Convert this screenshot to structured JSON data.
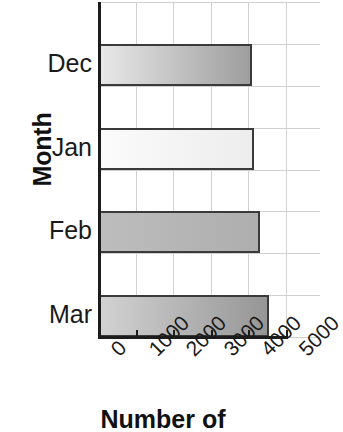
{
  "chart_data": {
    "type": "bar",
    "orientation": "horizontal",
    "title": "",
    "xlabel": "Number of",
    "ylabel": "Month",
    "categories": [
      "Dec",
      "Jan",
      "Feb",
      "Mar"
    ],
    "values": [
      4100,
      4150,
      4300,
      4550
    ],
    "xlim": [
      0,
      5000
    ],
    "xticks": [
      0,
      1000,
      2000,
      3000,
      4000,
      5000
    ],
    "xtick_labels": [
      "0",
      "1000",
      "2000",
      "3000",
      "4000",
      "5000"
    ],
    "xtick_rotation": -45,
    "grid": true,
    "grid_color": "#d2d2d2",
    "legend": "none",
    "bar_edge_color": "#3a3a3a",
    "bars": [
      {
        "category": "Dec",
        "value": 4100,
        "fill_start": "#e8e8e8",
        "fill_end": "#9e9e9e"
      },
      {
        "category": "Jan",
        "value": 4150,
        "fill_start": "#fbfbfb",
        "fill_end": "#ededed"
      },
      {
        "category": "Feb",
        "value": 4300,
        "fill_start": "#bdbdbd",
        "fill_end": "#aeaeae"
      },
      {
        "category": "Mar",
        "value": 4550,
        "fill_start": "#d2d2d2",
        "fill_end": "#969696"
      }
    ]
  },
  "axes": {
    "y_title": "Month",
    "x_title": "Number of",
    "y_tick_labels": [
      "Dec",
      "Jan",
      "Feb",
      "Mar"
    ],
    "x_tick_labels": [
      "0",
      "1000",
      "2000",
      "3000",
      "4000",
      "5000"
    ]
  }
}
